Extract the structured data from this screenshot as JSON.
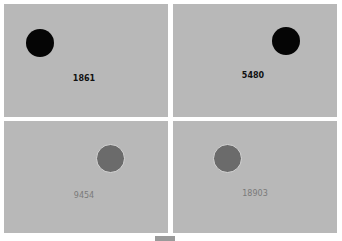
{
  "panels": [
    {
      "label": "1861",
      "dot": "black",
      "position": "top-left"
    },
    {
      "label": "5480",
      "dot": "black",
      "position": "top-right"
    },
    {
      "label": "9454",
      "dot": "gray",
      "position": "bottom-left"
    },
    {
      "label": "18903",
      "dot": "gray",
      "position": "bottom-right"
    }
  ],
  "colors": {
    "panel_bg": "#b8b8b8",
    "dot_black": "#050505",
    "dot_gray": "#6b6b6b",
    "label_dark": "#111111",
    "label_light": "#7a7a7a"
  }
}
